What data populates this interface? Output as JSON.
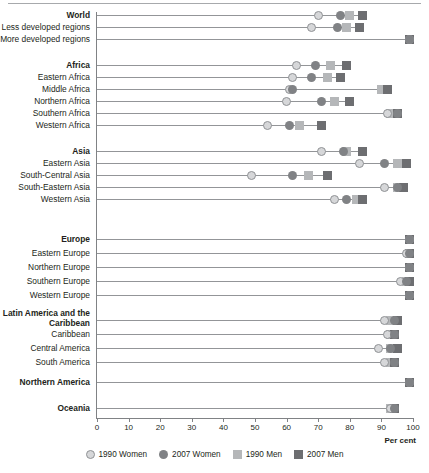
{
  "chart_data": {
    "type": "scatter",
    "title": "",
    "xlabel": "Per cent",
    "ylabel": "",
    "xlim": [
      0,
      100
    ],
    "xticks": [
      0,
      10,
      20,
      30,
      40,
      50,
      60,
      70,
      80,
      90,
      100
    ],
    "grid": false,
    "legend_position": "bottom",
    "series": [
      {
        "name": "1990 Women",
        "marker": "circle",
        "color": "#d6d7d9"
      },
      {
        "name": "2007 Women",
        "marker": "circle",
        "color": "#808285"
      },
      {
        "name": "1990 Men",
        "marker": "square",
        "color": "#b5b7b9"
      },
      {
        "name": "2007 Men",
        "marker": "square",
        "color": "#6d6e71"
      }
    ],
    "categories": [
      "World",
      "Less developed regions",
      "More developed regions",
      "Africa",
      "Eastern Africa",
      "Middle Africa",
      "Northern Africa",
      "Southern Africa",
      "Western Africa",
      "Asia",
      "Eastern Asia",
      "South-Central Asia",
      "South-Eastern Asia",
      "Western Asia",
      "Europe",
      "Eastern Europe",
      "Northern Europe",
      "Southern Europe",
      "Western Europe",
      "Latin America and the Caribbean",
      "Caribbean",
      "Central America",
      "South America",
      "Northern America",
      "Oceania"
    ],
    "values": {
      "1990 Women": [
        70,
        68,
        99,
        63,
        62,
        61,
        60,
        92,
        54,
        71,
        83,
        49,
        91,
        75,
        99,
        98,
        99,
        96,
        99,
        91,
        92,
        89,
        91,
        99,
        93
      ],
      "2007 Women": [
        77,
        76,
        99,
        69,
        68,
        62,
        71,
        95,
        61,
        78,
        91,
        62,
        95,
        79,
        99,
        99,
        99,
        98,
        99,
        94,
        94,
        93,
        94,
        99,
        94
      ],
      "1990 Men": [
        80,
        79,
        99,
        74,
        73,
        90,
        75,
        93,
        64,
        79,
        95,
        67,
        95,
        82,
        99,
        99,
        99,
        98,
        99,
        93,
        93,
        93,
        93,
        99,
        93
      ],
      "2007 Men": [
        84,
        83,
        99,
        79,
        77,
        92,
        80,
        95,
        71,
        84,
        98,
        73,
        97,
        84,
        99,
        99,
        99,
        99,
        99,
        95,
        94,
        95,
        94,
        99,
        94
      ]
    },
    "group_headers": [
      "World",
      "Africa",
      "Asia",
      "Europe",
      "Latin America and the Caribbean",
      "Northern America",
      "Oceania"
    ]
  },
  "axis": {
    "x_title": "Per cent",
    "tick_labels": [
      "0",
      "10",
      "20",
      "30",
      "40",
      "50",
      "60",
      "70",
      "80",
      "90",
      "100"
    ]
  },
  "rows": [
    {
      "label": "World",
      "bold": true,
      "y": 15,
      "p1990w": 70,
      "p2007w": 77,
      "p1990m": 80,
      "p2007m": 84
    },
    {
      "label": "Less developed regions",
      "bold": false,
      "y": 27,
      "p1990w": 68,
      "p2007w": 76,
      "p1990m": 79,
      "p2007m": 83
    },
    {
      "label": "More developed regions",
      "bold": false,
      "y": 39,
      "p1990w": 99,
      "p2007w": 99,
      "p1990m": 99,
      "p2007m": 99
    },
    {
      "label": "Africa",
      "bold": true,
      "y": 65,
      "p1990w": 63,
      "p2007w": 69,
      "p1990m": 74,
      "p2007m": 79
    },
    {
      "label": "Eastern Africa",
      "bold": false,
      "y": 77,
      "p1990w": 62,
      "p2007w": 68,
      "p1990m": 73,
      "p2007m": 77
    },
    {
      "label": "Middle Africa",
      "bold": false,
      "y": 89,
      "p1990w": 61,
      "p2007w": 62,
      "p1990m": 90,
      "p2007m": 92
    },
    {
      "label": "Northern Africa",
      "bold": false,
      "y": 101,
      "p1990w": 60,
      "p2007w": 71,
      "p1990m": 75,
      "p2007m": 80
    },
    {
      "label": "Southern Africa",
      "bold": false,
      "y": 113,
      "p1990w": 92,
      "p2007w": 95,
      "p1990m": 93,
      "p2007m": 95
    },
    {
      "label": "Western Africa",
      "bold": false,
      "y": 125,
      "p1990w": 54,
      "p2007w": 61,
      "p1990m": 64,
      "p2007m": 71
    },
    {
      "label": "Asia",
      "bold": true,
      "y": 151,
      "p1990w": 71,
      "p2007w": 78,
      "p1990m": 79,
      "p2007m": 84
    },
    {
      "label": "Eastern Asia",
      "bold": false,
      "y": 163,
      "p1990w": 83,
      "p2007w": 91,
      "p1990m": 95,
      "p2007m": 98
    },
    {
      "label": "South-Central Asia",
      "bold": false,
      "y": 175,
      "p1990w": 49,
      "p2007w": 62,
      "p1990m": 67,
      "p2007m": 73
    },
    {
      "label": "South-Eastern Asia",
      "bold": false,
      "y": 187,
      "p1990w": 91,
      "p2007w": 95,
      "p1990m": 95,
      "p2007m": 97
    },
    {
      "label": "Western Asia",
      "bold": false,
      "y": 199,
      "p1990w": 75,
      "p2007w": 79,
      "p1990m": 82,
      "p2007m": 84
    },
    {
      "label": "Europe",
      "bold": true,
      "y": 239,
      "p1990w": 99,
      "p2007w": 99,
      "p1990m": 99,
      "p2007m": 99
    },
    {
      "label": "Eastern Europe",
      "bold": false,
      "y": 253,
      "p1990w": 98,
      "p2007w": 99,
      "p1990m": 99,
      "p2007m": 99
    },
    {
      "label": "Northern Europe",
      "bold": false,
      "y": 267,
      "p1990w": 99,
      "p2007w": 99,
      "p1990m": 99,
      "p2007m": 99
    },
    {
      "label": "Southern Europe",
      "bold": false,
      "y": 281,
      "p1990w": 96,
      "p2007w": 98,
      "p1990m": 98,
      "p2007m": 99
    },
    {
      "label": "Western Europe",
      "bold": false,
      "y": 295,
      "p1990w": 99,
      "p2007w": 99,
      "p1990m": 99,
      "p2007m": 99
    },
    {
      "label": "Latin America and the Caribbean",
      "bold": true,
      "y": 320,
      "p1990w": 91,
      "p2007w": 94,
      "p1990m": 93,
      "p2007m": 95
    },
    {
      "label": "Caribbean",
      "bold": false,
      "y": 334,
      "p1990w": 92,
      "p2007w": 94,
      "p1990m": 93,
      "p2007m": 94
    },
    {
      "label": "Central America",
      "bold": false,
      "y": 348,
      "p1990w": 89,
      "p2007w": 93,
      "p1990m": 93,
      "p2007m": 95
    },
    {
      "label": "South America",
      "bold": false,
      "y": 362,
      "p1990w": 91,
      "p2007w": 94,
      "p1990m": 93,
      "p2007m": 94
    },
    {
      "label": "Northern America",
      "bold": true,
      "y": 382,
      "p1990w": 99,
      "p2007w": 99,
      "p1990m": 99,
      "p2007m": 99
    },
    {
      "label": "Oceania",
      "bold": true,
      "y": 408,
      "p1990w": 93,
      "p2007w": 94,
      "p1990m": 93,
      "p2007m": 94
    }
  ],
  "legend": [
    {
      "label": "1990 Women",
      "marker": "circle-light",
      "icon": "circle-marker-icon"
    },
    {
      "label": "2007 Women",
      "marker": "circle-dark",
      "icon": "circle-marker-icon"
    },
    {
      "label": "1990 Men",
      "marker": "square-light",
      "icon": "square-marker-icon"
    },
    {
      "label": "2007 Men",
      "marker": "square-dark",
      "icon": "square-marker-icon"
    }
  ],
  "colors": {
    "women_1990": "#d6d7d9",
    "women_2007": "#808285",
    "men_1990": "#b5b7b9",
    "men_2007": "#6d6e71",
    "axis": "#808285",
    "row_line": "#939598",
    "text": "#231f20"
  }
}
